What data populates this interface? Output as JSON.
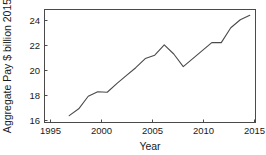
{
  "chart_data": {
    "type": "line",
    "title": "",
    "xlabel": "Year",
    "ylabel": "Aggregate Pay $ billion 2015",
    "xlim": [
      1994.4,
      2016.6
    ],
    "ylim": [
      15.4,
      25.3
    ],
    "grid": false,
    "legend": null,
    "xticks": [
      "1995",
      "2000",
      "2005",
      "2010",
      "2015"
    ],
    "xtick_values": [
      1995,
      2000,
      2005,
      2010,
      2015
    ],
    "yticks": [
      "16",
      "18",
      "20",
      "22",
      "24"
    ],
    "ytick_values": [
      16,
      18,
      20,
      22,
      24
    ],
    "x": [
      1997,
      1998,
      1999,
      2000,
      2001,
      2002,
      2003,
      2004,
      2005,
      2006,
      2007,
      2008,
      2009,
      2010,
      2011,
      2012,
      2013,
      2014,
      2015,
      2016
    ],
    "series": [
      {
        "name": "Aggregate Pay",
        "values": [
          16.0,
          16.6,
          17.7,
          18.1,
          18.05,
          18.8,
          19.5,
          20.2,
          21.0,
          21.3,
          22.2,
          21.4,
          20.3,
          21.0,
          21.7,
          22.4,
          22.4,
          23.7,
          24.4,
          24.8
        ]
      }
    ]
  },
  "axes": {
    "x_title": "Year",
    "y_title": "Aggregate Pay $ billion 2015"
  }
}
